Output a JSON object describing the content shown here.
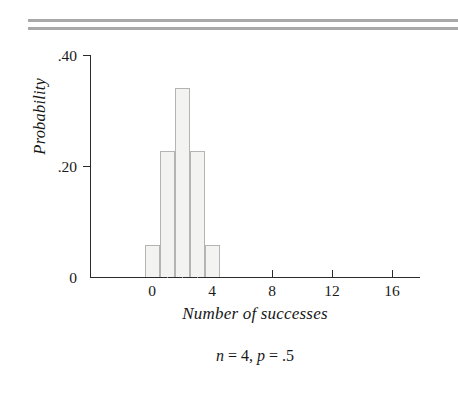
{
  "figure": {
    "caption": "n = 4, p = .5",
    "caption_parts": {
      "n_symbol": "n",
      "n_value": " = 4, ",
      "p_symbol": "p",
      "p_value": " = .5"
    },
    "rules": {
      "count": 2,
      "color": "#a9a9a9"
    }
  },
  "chart_data": {
    "type": "bar",
    "title": "",
    "subtitle": "n = 4, p = .5",
    "xlabel": "Number of successes",
    "ylabel": "Probability",
    "categories": [
      0,
      1,
      2,
      3,
      4
    ],
    "values": [
      0.0625,
      0.25,
      0.375,
      0.25,
      0.0625
    ],
    "x": [
      0,
      1,
      2,
      3,
      4
    ],
    "xlim": [
      -2,
      20
    ],
    "ylim": [
      0,
      0.44
    ],
    "xticks": [
      0,
      4,
      8,
      12,
      16
    ],
    "xtick_labels": [
      "0",
      "4",
      "8",
      "12",
      "16"
    ],
    "yticks": [
      0,
      0.2,
      0.4
    ],
    "ytick_labels": [
      "0",
      ".20",
      ".40"
    ],
    "grid": false,
    "legend": "none",
    "bar_fill": "#f3f3f1",
    "bar_edge": "#b4b4b2",
    "axis_color": "#2b2b2b",
    "distribution": "binomial",
    "parameters": {
      "n": 4,
      "p": 0.5
    }
  },
  "bars": [
    {
      "label": "0",
      "value": 0.0625
    },
    {
      "label": "1",
      "value": 0.25
    },
    {
      "label": "2",
      "value": 0.375
    },
    {
      "label": "3",
      "value": 0.25
    },
    {
      "label": "4",
      "value": 0.0625
    }
  ],
  "axes": {
    "y_labels": [
      ".40",
      ".20",
      "0"
    ],
    "x_labels": [
      "0",
      "4",
      "8",
      "12",
      "16"
    ]
  }
}
